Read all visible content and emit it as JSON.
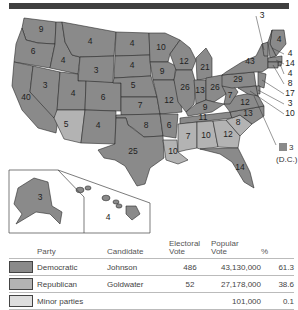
{
  "title_bar": "",
  "colors": {
    "democratic": "#8a8a8a",
    "republican": "#b3b3b3",
    "minor": "#dedede",
    "topbar": "#3f3f3f"
  },
  "map": {
    "states": [
      {
        "name": "Washington",
        "ev": "9",
        "party": "democratic"
      },
      {
        "name": "Oregon",
        "ev": "6",
        "party": "democratic"
      },
      {
        "name": "California",
        "ev": "40",
        "party": "democratic"
      },
      {
        "name": "Idaho",
        "ev": "4",
        "party": "democratic"
      },
      {
        "name": "Nevada",
        "ev": "3",
        "party": "democratic"
      },
      {
        "name": "Montana",
        "ev": "4",
        "party": "democratic"
      },
      {
        "name": "Wyoming",
        "ev": "3",
        "party": "democratic"
      },
      {
        "name": "Utah",
        "ev": "4",
        "party": "democratic"
      },
      {
        "name": "Arizona",
        "ev": "5",
        "party": "republican"
      },
      {
        "name": "Colorado",
        "ev": "6",
        "party": "democratic"
      },
      {
        "name": "New Mexico",
        "ev": "4",
        "party": "democratic"
      },
      {
        "name": "North Dakota",
        "ev": "4",
        "party": "democratic"
      },
      {
        "name": "South Dakota",
        "ev": "4",
        "party": "democratic"
      },
      {
        "name": "Nebraska",
        "ev": "5",
        "party": "democratic"
      },
      {
        "name": "Kansas",
        "ev": "7",
        "party": "democratic"
      },
      {
        "name": "Oklahoma",
        "ev": "8",
        "party": "democratic"
      },
      {
        "name": "Texas",
        "ev": "25",
        "party": "democratic"
      },
      {
        "name": "Minnesota",
        "ev": "10",
        "party": "democratic"
      },
      {
        "name": "Iowa",
        "ev": "9",
        "party": "democratic"
      },
      {
        "name": "Missouri",
        "ev": "12",
        "party": "democratic"
      },
      {
        "name": "Arkansas",
        "ev": "6",
        "party": "democratic"
      },
      {
        "name": "Louisiana",
        "ev": "10",
        "party": "republican"
      },
      {
        "name": "Wisconsin",
        "ev": "12",
        "party": "democratic"
      },
      {
        "name": "Illinois",
        "ev": "26",
        "party": "democratic"
      },
      {
        "name": "Michigan",
        "ev": "21",
        "party": "democratic"
      },
      {
        "name": "Indiana",
        "ev": "13",
        "party": "democratic"
      },
      {
        "name": "Ohio",
        "ev": "26",
        "party": "democratic"
      },
      {
        "name": "Kentucky",
        "ev": "9",
        "party": "democratic"
      },
      {
        "name": "Tennessee",
        "ev": "11",
        "party": "democratic"
      },
      {
        "name": "Mississippi",
        "ev": "7",
        "party": "republican"
      },
      {
        "name": "Alabama",
        "ev": "10",
        "party": "republican"
      },
      {
        "name": "Georgia",
        "ev": "12",
        "party": "republican"
      },
      {
        "name": "South Carolina",
        "ev": "8",
        "party": "republican"
      },
      {
        "name": "Florida",
        "ev": "14",
        "party": "democratic"
      },
      {
        "name": "North Carolina",
        "ev": "13",
        "party": "democratic"
      },
      {
        "name": "Virginia",
        "ev": "12",
        "party": "democratic"
      },
      {
        "name": "West Virginia",
        "ev": "7",
        "party": "democratic"
      },
      {
        "name": "Pennsylvania",
        "ev": "29",
        "party": "democratic"
      },
      {
        "name": "New York",
        "ev": "43",
        "party": "democratic"
      },
      {
        "name": "Vermont",
        "ev": "3",
        "party": "democratic"
      },
      {
        "name": "Maine",
        "ev": "4",
        "party": "democratic"
      },
      {
        "name": "New Hampshire",
        "ev": "4",
        "party": "democratic"
      },
      {
        "name": "Massachusetts",
        "ev": "14",
        "party": "democratic"
      },
      {
        "name": "Rhode Island",
        "ev": "4",
        "party": "democratic"
      },
      {
        "name": "Connecticut",
        "ev": "8",
        "party": "democratic"
      },
      {
        "name": "New Jersey",
        "ev": "17",
        "party": "democratic"
      },
      {
        "name": "Delaware",
        "ev": "3",
        "party": "democratic"
      },
      {
        "name": "Maryland",
        "ev": "10",
        "party": "democratic"
      },
      {
        "name": "Alaska",
        "ev": "3",
        "party": "democratic"
      },
      {
        "name": "Hawaii",
        "ev": "4",
        "party": "democratic"
      }
    ],
    "dc": {
      "ev": "3",
      "label": "(D.C.)",
      "party": "democratic"
    }
  },
  "table": {
    "headers": {
      "party": "Party",
      "candidate": "Candidate",
      "electoral_1": "Electoral",
      "electoral_2": "Vote",
      "popular_1": "Popular",
      "popular_2": "Vote",
      "percent": "%"
    },
    "rows": [
      {
        "party": "Democratic",
        "candidate": "Johnson",
        "electoral": "486",
        "popular": "43,130,000",
        "percent": "61.3",
        "color": "#8a8a8a"
      },
      {
        "party": "Republican",
        "candidate": "Goldwater",
        "electoral": "52",
        "popular": "27,178,000",
        "percent": "38.6",
        "color": "#b3b3b3"
      },
      {
        "party": "Minor parties",
        "candidate": "",
        "electoral": "",
        "popular": "101,000",
        "percent": "0.1",
        "color": "#dedede"
      }
    ]
  }
}
